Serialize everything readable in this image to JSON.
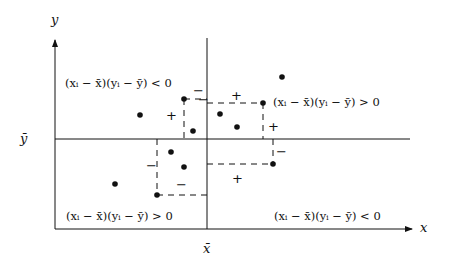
{
  "diagram": {
    "title": "",
    "axes": {
      "x_label": "x",
      "y_label": "y",
      "x_mean_label": "x̄",
      "y_mean_label": "ȳ"
    },
    "quadrant_labels": {
      "top_left": "(xᵢ − x̄)(yᵢ − ȳ) < 0",
      "top_right": "(xᵢ − x̄)(yᵢ − ȳ) > 0",
      "bottom_left": "(xᵢ − x̄)(yᵢ − ȳ) > 0",
      "bottom_right": "(xᵢ − x̄)(yᵢ − ȳ) < 0"
    },
    "signs": {
      "tl_plus": "+",
      "tl_minus_h": "−",
      "tl_minus_v": "−",
      "tr_plus_h": "+",
      "tr_plus_v": "+",
      "bl_minus_v": "−",
      "bl_minus_h": "−",
      "br_minus_v": "−",
      "br_plus_h": "+"
    },
    "points": [
      {
        "x": 140,
        "y": 115
      },
      {
        "x": 184,
        "y": 99
      },
      {
        "x": 193,
        "y": 131
      },
      {
        "x": 220,
        "y": 114
      },
      {
        "x": 237,
        "y": 127
      },
      {
        "x": 263,
        "y": 103
      },
      {
        "x": 282,
        "y": 77
      },
      {
        "x": 171,
        "y": 152
      },
      {
        "x": 184,
        "y": 167
      },
      {
        "x": 115,
        "y": 184
      },
      {
        "x": 157,
        "y": 195
      },
      {
        "x": 273,
        "y": 164
      }
    ],
    "colors": {
      "ink": "#111111",
      "background": "#ffffff"
    }
  }
}
